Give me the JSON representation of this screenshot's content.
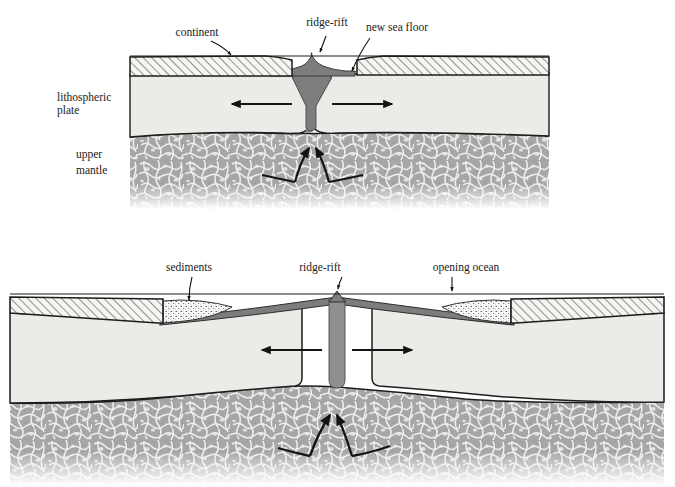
{
  "figure": {
    "domain": "Diagram",
    "kind": "geological cross-section",
    "panels": [
      {
        "id": "panel-top",
        "stage_label": "continental rifting / early sea-floor spreading",
        "callout_labels": [
          {
            "name": "continent",
            "text": "continent"
          },
          {
            "name": "ridge-rift",
            "text": "ridge-rift"
          },
          {
            "name": "new-sea-floor",
            "text": "new sea floor"
          }
        ],
        "side_labels": [
          {
            "name": "lithospheric-plate",
            "line1": "lithospheric",
            "line2": "plate"
          },
          {
            "name": "upper-mantle",
            "line1": "upper",
            "line2": "mantle"
          }
        ],
        "spreading_arrows": [
          "left",
          "right"
        ],
        "convection_arrows": [
          "up-left-curve",
          "up-right-curve"
        ]
      },
      {
        "id": "panel-bottom",
        "stage_label": "opening ocean basin with sedimented margins",
        "callout_labels": [
          {
            "name": "sediments",
            "text": "sediments"
          },
          {
            "name": "ridge-rift",
            "text": "ridge-rift"
          },
          {
            "name": "opening-ocean",
            "text": "opening ocean"
          }
        ],
        "side_labels": [],
        "spreading_arrows": [
          "left",
          "right"
        ],
        "convection_arrows": [
          "up-left-curve",
          "up-right-curve"
        ]
      }
    ],
    "layers": [
      {
        "name": "continental-crust",
        "pattern": "diagonal-hatch",
        "fill": "#f2f2ee"
      },
      {
        "name": "oceanic-crust-new-sea-floor",
        "pattern": "solid",
        "fill": "#7d7d7d"
      },
      {
        "name": "lithospheric-plate",
        "pattern": "solid",
        "fill": "#ececeb"
      },
      {
        "name": "upper-mantle",
        "pattern": "mottled-scribble",
        "fill": "#a8a8a8"
      },
      {
        "name": "sediments",
        "pattern": "stipple",
        "fill": "#fbfbf9"
      },
      {
        "name": "sea-level-line",
        "pattern": "thin-line",
        "fill": "#1a1a1a"
      }
    ],
    "colors": {
      "background": "#ffffff",
      "ink": "#1a1a1a",
      "crust_fill": "#f2f2ee",
      "lithosphere_fill": "#ececeb",
      "mantle_fill": "#a8a8a8",
      "oceanic_crust_fill": "#7d7d7d",
      "sediment_fill": "#fbfbf9"
    }
  }
}
